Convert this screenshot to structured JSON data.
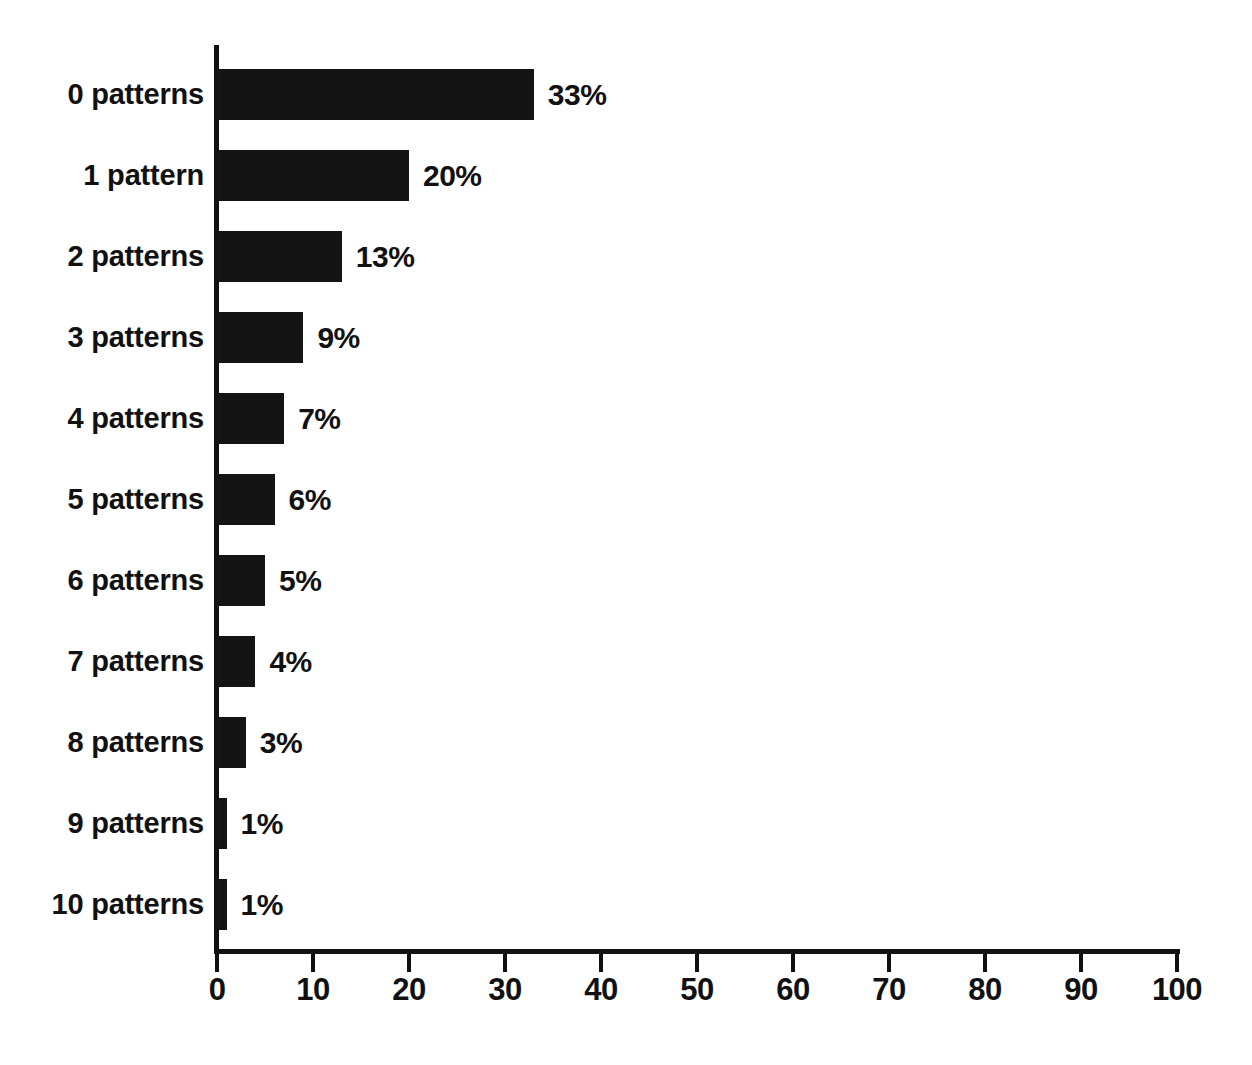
{
  "chart_data": {
    "type": "bar",
    "orientation": "horizontal",
    "title": "",
    "subtitle": "",
    "xlabel": "",
    "ylabel": "",
    "xlim": [
      0,
      100
    ],
    "grid": false,
    "legend": null,
    "value_label_suffix": "%",
    "categories": [
      "0 patterns",
      "1 pattern",
      "2 patterns",
      "3 patterns",
      "4 patterns",
      "5 patterns",
      "6 patterns",
      "7 patterns",
      "8 patterns",
      "9 patterns",
      "10 patterns"
    ],
    "values": [
      33,
      20,
      13,
      9,
      7,
      6,
      5,
      4,
      3,
      1,
      1
    ],
    "value_labels": [
      "33%",
      "20%",
      "13%",
      "9%",
      "7%",
      "6%",
      "5%",
      "4%",
      "3%",
      "1%",
      "1%"
    ],
    "xticks": [
      0,
      10,
      20,
      30,
      40,
      50,
      60,
      70,
      80,
      90,
      100
    ],
    "xtick_labels": [
      "0",
      "10",
      "20",
      "30",
      "40",
      "50",
      "60",
      "70",
      "80",
      "90",
      "100"
    ],
    "colors": {
      "bar": "#141414",
      "axis": "#111111",
      "text": "#111111",
      "background": "#ffffff"
    }
  }
}
